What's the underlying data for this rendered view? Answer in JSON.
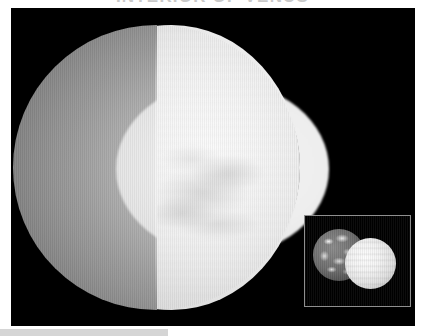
{
  "page": {
    "title": "INTERIOR OF VENUS",
    "background_color": "#ffffff"
  },
  "figure": {
    "name": "venus-cutaway-figure",
    "background_color": "#000000",
    "planet": {
      "label": "Venus",
      "cutaway": true,
      "layers": [
        {
          "name": "clouds",
          "label": "Cloud layer / atmosphere",
          "color": "#f6f6f6"
        },
        {
          "name": "crust",
          "label": "Crust",
          "color": "#9a9a9a"
        },
        {
          "name": "mantle",
          "label": "Mantle",
          "color": "#787878"
        },
        {
          "name": "core",
          "label": "Core",
          "color": "#eeeeee"
        },
        {
          "name": "cut-face",
          "label": "Cut face",
          "color": "#2a2a2a"
        }
      ]
    },
    "inset": {
      "name": "size-comparison-inset",
      "caption": "",
      "border_color": "#8f8f8f",
      "bodies": [
        {
          "name": "earth",
          "label": "Earth"
        },
        {
          "name": "venus",
          "label": "Venus"
        }
      ]
    }
  },
  "caption": {
    "text": ""
  }
}
